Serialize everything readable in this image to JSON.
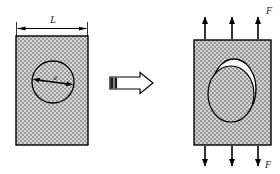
{
  "figure": {
    "background_color": "#ffffff",
    "line_color": "#000000",
    "hatch_color": "#8c8c8c",
    "hole_fill": "#ffffff"
  },
  "left_panel": {
    "name": "undeformed-plate",
    "dimension_label": "L",
    "diameter_label": "d",
    "plate": {
      "x": 16,
      "y": 36,
      "width": 72,
      "height": 109
    },
    "hole": {
      "cx": 53,
      "cy": 82,
      "r": 21
    },
    "dimension_line": {
      "x1": 16,
      "x2": 88,
      "y": 28
    }
  },
  "arrow_glyph": {
    "name": "transform-arrow",
    "label": "",
    "x": 112,
    "y": 82
  },
  "right_panel": {
    "name": "deformed-plate",
    "force_label_top": "F",
    "force_label_bottom": "F",
    "plate": {
      "x": 194,
      "y": 40,
      "width": 77,
      "height": 105
    },
    "hole_outer": {
      "cx": 233,
      "cy": 90,
      "rx": 22,
      "ry": 30
    },
    "hole_inner": {
      "cx": 231,
      "cy": 94,
      "rx": 23,
      "ry": 28
    },
    "top_arrows_x": [
      205,
      232,
      258
    ],
    "bottom_arrows_x": [
      205,
      232,
      258
    ]
  }
}
